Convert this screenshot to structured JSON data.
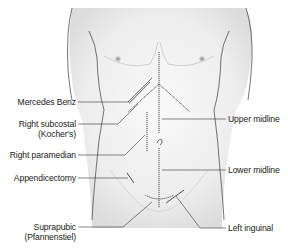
{
  "diagram": {
    "colors": {
      "skin_fill": "#ececec",
      "skin_highlight": "#f8f8f8",
      "outline": "#3a3a3a",
      "incision": "#4a4a4a",
      "leader_line": "#333333",
      "nipple": "#9a9a9a",
      "text": "#222222"
    },
    "labels_left": [
      {
        "id": "mercedes-benz",
        "text": "Mercedes Benz"
      },
      {
        "id": "right-subcostal",
        "text": "Right subcostal",
        "text2": "(Kocher's)"
      },
      {
        "id": "right-paramedian",
        "text": "Right paramedian"
      },
      {
        "id": "appendicectomy",
        "text": "Appendicectomy"
      },
      {
        "id": "suprapubic",
        "text": "Suprapubic",
        "text2": "(Pfannenstiel)"
      }
    ],
    "labels_right": [
      {
        "id": "upper-midline",
        "text": "Upper midline"
      },
      {
        "id": "lower-midline",
        "text": "Lower midline"
      },
      {
        "id": "left-inguinal",
        "text": "Left inguinal"
      }
    ]
  }
}
